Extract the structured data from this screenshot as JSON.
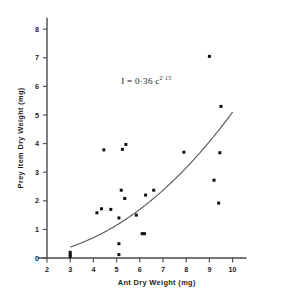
{
  "chart_data": {
    "type": "scatter",
    "title": "",
    "xlabel": "Ant Dry Weight (mg)",
    "ylabel": "Prey Item Dry Weight (mg)",
    "xlim": [
      2,
      10.6
    ],
    "ylim": [
      0,
      8.4
    ],
    "xticks": [
      2,
      3,
      4,
      5,
      6,
      7,
      8,
      9,
      10
    ],
    "yticks": [
      0,
      1,
      2,
      3,
      4,
      5,
      6,
      7,
      8
    ],
    "xtick_labels": [
      "2",
      "3",
      "4",
      "5",
      "6",
      "7",
      "8",
      "9",
      "10"
    ],
    "ytick_labels": [
      "0",
      "1",
      "2",
      "3",
      "4",
      "5",
      "6",
      "7",
      "8"
    ],
    "grid": false,
    "legend": null,
    "points": [
      [
        3.0,
        0.05
      ],
      [
        3.0,
        0.12
      ],
      [
        3.0,
        0.2
      ],
      [
        4.15,
        1.58
      ],
      [
        4.35,
        1.72
      ],
      [
        4.45,
        3.78
      ],
      [
        4.75,
        1.7
      ],
      [
        5.1,
        0.12
      ],
      [
        5.1,
        0.5
      ],
      [
        5.1,
        1.4
      ],
      [
        5.2,
        2.37
      ],
      [
        5.25,
        3.8
      ],
      [
        5.35,
        2.08
      ],
      [
        5.4,
        3.97
      ],
      [
        5.85,
        1.5
      ],
      [
        6.1,
        0.85
      ],
      [
        6.2,
        0.85
      ],
      [
        6.25,
        2.2
      ],
      [
        6.6,
        2.37
      ],
      [
        7.9,
        3.7
      ],
      [
        9.0,
        7.05
      ],
      [
        9.2,
        2.72
      ],
      [
        9.4,
        1.92
      ],
      [
        9.45,
        3.68
      ],
      [
        9.5,
        5.3
      ]
    ],
    "fit_curve": {
      "equation_display": "I = 0·36 c",
      "equation_exponent": "2·15",
      "coefficient": 0.36,
      "exponent": 2.15,
      "x_start": 3.0,
      "x_end": 10.0
    },
    "annotation": {
      "text": "I = 0·36 c",
      "exponent": "2·15",
      "x": 5.2,
      "y": 6.1
    }
  },
  "colors": {
    "point": "#111111",
    "curve": "#55555a",
    "axis": "#4a4a4a",
    "text": "#1d1d1d",
    "background": "#ffffff"
  }
}
